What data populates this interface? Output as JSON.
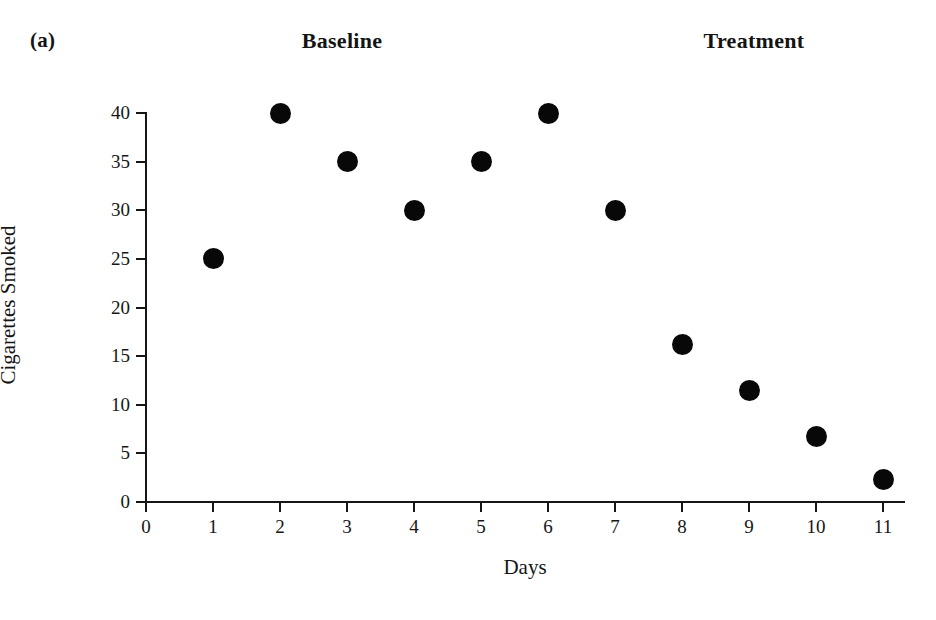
{
  "figure": {
    "panel_label": "(a)",
    "phases": [
      {
        "name": "baseline",
        "label": "Baseline"
      },
      {
        "name": "treatment",
        "label": "Treatment"
      }
    ]
  },
  "chart_data": {
    "type": "scatter",
    "title": "",
    "panel_label": "(a)",
    "xlabel": "Days",
    "ylabel": "Cigarettes Smoked",
    "xlim": [
      0,
      11
    ],
    "ylim": [
      0,
      40
    ],
    "xticks": [
      0,
      1,
      2,
      3,
      4,
      5,
      6,
      7,
      8,
      9,
      10,
      11
    ],
    "xtick_labels": [
      "0",
      "1",
      "2",
      "3",
      "4",
      "5",
      "6",
      "7",
      "8",
      "9",
      "10",
      "11"
    ],
    "yticks": [
      0,
      5,
      10,
      15,
      20,
      25,
      30,
      35,
      40
    ],
    "ytick_labels": [
      "0",
      "5",
      "10",
      "15",
      "20",
      "25",
      "30",
      "35",
      "40"
    ],
    "grid": false,
    "legend": null,
    "marker": {
      "shape": "circle",
      "color": "#080808",
      "size": 21
    },
    "annotations": [
      {
        "text": "Baseline",
        "x": 3.0,
        "position": "above-plot"
      },
      {
        "text": "Treatment",
        "x": 9.1,
        "position": "above-plot"
      }
    ],
    "x": [
      1,
      2,
      3,
      4,
      5,
      6,
      7,
      8,
      9,
      10,
      11
    ],
    "values": [
      25,
      40,
      35,
      30,
      35,
      40,
      30,
      16.2,
      11.5,
      6.7,
      2.3
    ],
    "points": [
      {
        "x": 1,
        "y": 25,
        "phase": "Baseline"
      },
      {
        "x": 2,
        "y": 40,
        "phase": "Baseline"
      },
      {
        "x": 3,
        "y": 35,
        "phase": "Baseline"
      },
      {
        "x": 4,
        "y": 30,
        "phase": "Baseline"
      },
      {
        "x": 5,
        "y": 35,
        "phase": "Baseline"
      },
      {
        "x": 6,
        "y": 40,
        "phase": "Baseline"
      },
      {
        "x": 7,
        "y": 30,
        "phase": "Treatment"
      },
      {
        "x": 8,
        "y": 16.2,
        "phase": "Treatment"
      },
      {
        "x": 9,
        "y": 11.5,
        "phase": "Treatment"
      },
      {
        "x": 10,
        "y": 6.7,
        "phase": "Treatment"
      },
      {
        "x": 11,
        "y": 2.3,
        "phase": "Treatment"
      }
    ]
  }
}
